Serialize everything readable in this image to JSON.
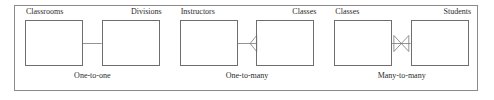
{
  "diagram": {
    "frame_border_color": "#8a8a8a",
    "box_border_color": "#6e6e6e",
    "line_color": "#6e6e6e",
    "background_color": "#ffffff",
    "groups": [
      {
        "id": "one-to-one",
        "caption": "One-to-one",
        "left_entity": "Classrooms",
        "right_entity": "Divisions",
        "left_marker": "plain",
        "right_marker": "plain"
      },
      {
        "id": "one-to-many",
        "caption": "One-to-many",
        "left_entity": "Instructors",
        "right_entity": "Classes",
        "left_marker": "plain",
        "right_marker": "crows-foot"
      },
      {
        "id": "many-to-many",
        "caption": "Many-to-many",
        "left_entity": "Classes",
        "right_entity": "Students",
        "left_marker": "crows-foot",
        "right_marker": "crows-foot"
      }
    ]
  }
}
